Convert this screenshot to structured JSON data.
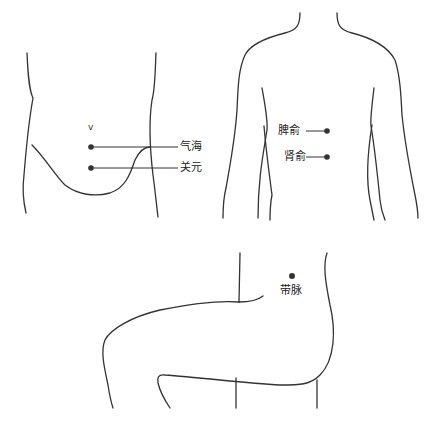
{
  "figures": [
    {
      "id": "abdomen-front",
      "points": [
        {
          "label": "气海"
        },
        {
          "label": "关元"
        }
      ],
      "navel_mark": "v"
    },
    {
      "id": "back",
      "points": [
        {
          "label": "脾俞"
        },
        {
          "label": "肾俞"
        }
      ]
    },
    {
      "id": "side-hip",
      "points": [
        {
          "label": "带脉"
        }
      ]
    }
  ]
}
